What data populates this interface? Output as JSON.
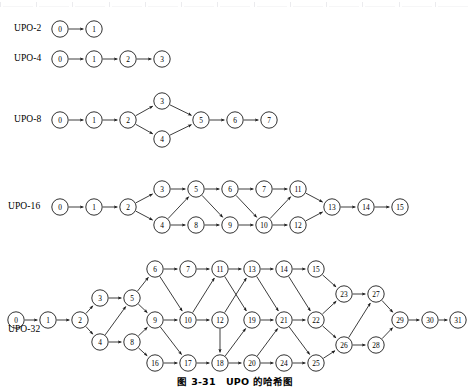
{
  "caption": "图 3-31　UPO 的哈希图",
  "ruler": {
    "visible": true,
    "tick_count": 13
  },
  "graph_style": {
    "node_radius": 8.2,
    "node_fill": "#ffffff",
    "node_stroke": "#1a1a1a",
    "edge_color": "#1a1a1a",
    "text_color": "#000000",
    "background": "#ffffff"
  },
  "rows": [
    {
      "id": "upo-2",
      "label": "UPO-2",
      "label_x": 14,
      "label_y": 29,
      "nodes": [
        {
          "id": "0",
          "x": 60,
          "y": 29
        },
        {
          "id": "1",
          "x": 94,
          "y": 29
        }
      ],
      "edges": [
        [
          "0",
          "1"
        ]
      ]
    },
    {
      "id": "upo-4",
      "label": "UPO-4",
      "label_x": 14,
      "label_y": 59,
      "nodes": [
        {
          "id": "0",
          "x": 60,
          "y": 59
        },
        {
          "id": "1",
          "x": 94,
          "y": 59
        },
        {
          "id": "2",
          "x": 128,
          "y": 59
        },
        {
          "id": "3",
          "x": 162,
          "y": 59
        }
      ],
      "edges": [
        [
          "0",
          "1"
        ],
        [
          "1",
          "2"
        ],
        [
          "2",
          "3"
        ]
      ]
    },
    {
      "id": "upo-8",
      "label": "UPO-8",
      "label_x": 14,
      "label_y": 120,
      "nodes": [
        {
          "id": "0",
          "x": 60,
          "y": 120
        },
        {
          "id": "1",
          "x": 94,
          "y": 120
        },
        {
          "id": "2",
          "x": 128,
          "y": 120
        },
        {
          "id": "3",
          "x": 162,
          "y": 101
        },
        {
          "id": "4",
          "x": 162,
          "y": 139
        },
        {
          "id": "5",
          "x": 201,
          "y": 120
        },
        {
          "id": "6",
          "x": 235,
          "y": 120
        },
        {
          "id": "7",
          "x": 269,
          "y": 120
        }
      ],
      "edges": [
        [
          "0",
          "1"
        ],
        [
          "1",
          "2"
        ],
        [
          "2",
          "3"
        ],
        [
          "2",
          "4"
        ],
        [
          "3",
          "5"
        ],
        [
          "4",
          "5"
        ],
        [
          "5",
          "6"
        ],
        [
          "6",
          "7"
        ]
      ]
    },
    {
      "id": "upo-16",
      "label": "UPO-16",
      "label_x": 8,
      "label_y": 207,
      "nodes": [
        {
          "id": "0",
          "x": 60,
          "y": 207
        },
        {
          "id": "1",
          "x": 94,
          "y": 207
        },
        {
          "id": "2",
          "x": 128,
          "y": 207
        },
        {
          "id": "3",
          "x": 162,
          "y": 189
        },
        {
          "id": "4",
          "x": 162,
          "y": 225
        },
        {
          "id": "5",
          "x": 196,
          "y": 189
        },
        {
          "id": "6",
          "x": 230,
          "y": 189
        },
        {
          "id": "7",
          "x": 264,
          "y": 189
        },
        {
          "id": "8",
          "x": 196,
          "y": 225
        },
        {
          "id": "9",
          "x": 230,
          "y": 225
        },
        {
          "id": "10",
          "x": 264,
          "y": 225
        },
        {
          "id": "11",
          "x": 298,
          "y": 189
        },
        {
          "id": "12",
          "x": 298,
          "y": 225
        },
        {
          "id": "13",
          "x": 332,
          "y": 207
        },
        {
          "id": "14",
          "x": 366,
          "y": 207
        },
        {
          "id": "15",
          "x": 400,
          "y": 207
        }
      ],
      "edges": [
        [
          "0",
          "1"
        ],
        [
          "1",
          "2"
        ],
        [
          "2",
          "3"
        ],
        [
          "2",
          "4"
        ],
        [
          "3",
          "5"
        ],
        [
          "4",
          "5"
        ],
        [
          "4",
          "8"
        ],
        [
          "5",
          "6"
        ],
        [
          "5",
          "9"
        ],
        [
          "8",
          "9"
        ],
        [
          "6",
          "7"
        ],
        [
          "6",
          "10"
        ],
        [
          "9",
          "10"
        ],
        [
          "7",
          "11"
        ],
        [
          "10",
          "11"
        ],
        [
          "10",
          "12"
        ],
        [
          "11",
          "13"
        ],
        [
          "12",
          "13"
        ],
        [
          "13",
          "14"
        ],
        [
          "14",
          "15"
        ]
      ]
    },
    {
      "id": "upo-32",
      "label": "UPO-32",
      "label_x": 8,
      "label_y": 330,
      "nodes": [
        {
          "id": "0",
          "x": 16,
          "y": 320
        },
        {
          "id": "1",
          "x": 48,
          "y": 320
        },
        {
          "id": "2",
          "x": 80,
          "y": 320
        },
        {
          "id": "3",
          "x": 100,
          "y": 298
        },
        {
          "id": "4",
          "x": 100,
          "y": 342
        },
        {
          "id": "5",
          "x": 132,
          "y": 298
        },
        {
          "id": "8",
          "x": 132,
          "y": 342
        },
        {
          "id": "6",
          "x": 155,
          "y": 269
        },
        {
          "id": "9",
          "x": 155,
          "y": 320
        },
        {
          "id": "16",
          "x": 155,
          "y": 363
        },
        {
          "id": "7",
          "x": 188,
          "y": 269
        },
        {
          "id": "10",
          "x": 188,
          "y": 320
        },
        {
          "id": "17",
          "x": 188,
          "y": 363
        },
        {
          "id": "11",
          "x": 220,
          "y": 269
        },
        {
          "id": "12",
          "x": 220,
          "y": 320
        },
        {
          "id": "18",
          "x": 220,
          "y": 363
        },
        {
          "id": "13",
          "x": 252,
          "y": 269
        },
        {
          "id": "19",
          "x": 252,
          "y": 320
        },
        {
          "id": "20",
          "x": 252,
          "y": 363
        },
        {
          "id": "14",
          "x": 284,
          "y": 269
        },
        {
          "id": "21",
          "x": 284,
          "y": 320
        },
        {
          "id": "24",
          "x": 284,
          "y": 363
        },
        {
          "id": "15",
          "x": 316,
          "y": 269
        },
        {
          "id": "22",
          "x": 316,
          "y": 320
        },
        {
          "id": "25",
          "x": 316,
          "y": 363
        },
        {
          "id": "23",
          "x": 344,
          "y": 294
        },
        {
          "id": "26",
          "x": 344,
          "y": 345
        },
        {
          "id": "27",
          "x": 376,
          "y": 294
        },
        {
          "id": "28",
          "x": 376,
          "y": 345
        },
        {
          "id": "29",
          "x": 400,
          "y": 320
        },
        {
          "id": "30",
          "x": 430,
          "y": 320
        },
        {
          "id": "31",
          "x": 458,
          "y": 320
        }
      ],
      "edges": [
        [
          "0",
          "1"
        ],
        [
          "1",
          "2"
        ],
        [
          "2",
          "3"
        ],
        [
          "2",
          "4"
        ],
        [
          "3",
          "5"
        ],
        [
          "4",
          "5"
        ],
        [
          "4",
          "8"
        ],
        [
          "5",
          "6"
        ],
        [
          "5",
          "9"
        ],
        [
          "8",
          "9"
        ],
        [
          "8",
          "16"
        ],
        [
          "6",
          "7"
        ],
        [
          "6",
          "10"
        ],
        [
          "9",
          "10"
        ],
        [
          "9",
          "17"
        ],
        [
          "16",
          "17"
        ],
        [
          "7",
          "11"
        ],
        [
          "10",
          "11"
        ],
        [
          "10",
          "12"
        ],
        [
          "17",
          "18"
        ],
        [
          "12",
          "18"
        ],
        [
          "11",
          "13"
        ],
        [
          "12",
          "13"
        ],
        [
          "11",
          "19"
        ],
        [
          "18",
          "19"
        ],
        [
          "18",
          "20"
        ],
        [
          "13",
          "14"
        ],
        [
          "13",
          "21"
        ],
        [
          "19",
          "21"
        ],
        [
          "20",
          "21"
        ],
        [
          "20",
          "24"
        ],
        [
          "14",
          "15"
        ],
        [
          "14",
          "22"
        ],
        [
          "21",
          "22"
        ],
        [
          "21",
          "25"
        ],
        [
          "24",
          "25"
        ],
        [
          "15",
          "23"
        ],
        [
          "22",
          "23"
        ],
        [
          "22",
          "26"
        ],
        [
          "25",
          "26"
        ],
        [
          "23",
          "27"
        ],
        [
          "26",
          "27"
        ],
        [
          "26",
          "28"
        ],
        [
          "27",
          "29"
        ],
        [
          "28",
          "29"
        ],
        [
          "29",
          "30"
        ],
        [
          "30",
          "31"
        ]
      ]
    }
  ]
}
